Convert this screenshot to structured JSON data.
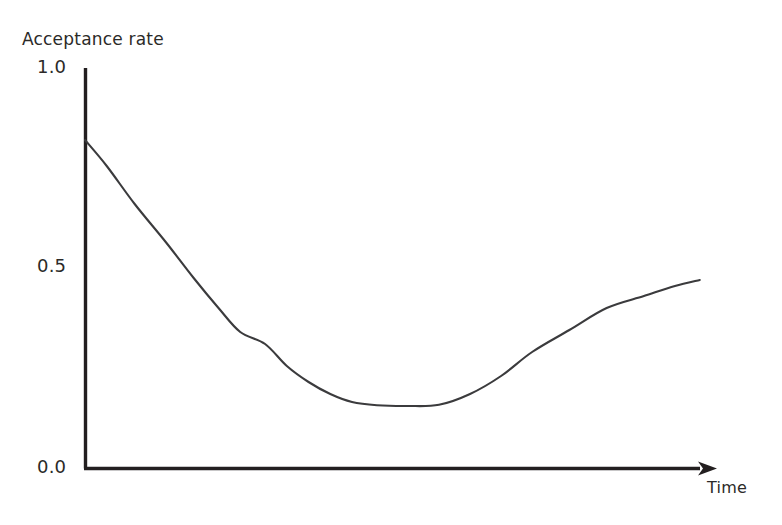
{
  "chart_data": {
    "type": "line",
    "title": "",
    "subtitle": "",
    "xlabel": "Time",
    "ylabel": "Acceptance rate",
    "ylim": [
      0.0,
      1.0
    ],
    "xlim": [
      0,
      1
    ],
    "grid": false,
    "legend": null,
    "legend_position": "none",
    "y_ticks": [
      "1.0",
      "0.5",
      "0.0"
    ],
    "y_tick_values": [
      1.0,
      0.5,
      0.0
    ],
    "x_ticks": [],
    "x_tick_values": [],
    "axis_style": "open-left-and-bottom-with-arrow",
    "series": [
      {
        "name": "Acceptance rate",
        "color": "#3b3b3d",
        "x": [
          0.0,
          0.035,
          0.08,
          0.13,
          0.175,
          0.215,
          0.25,
          0.29,
          0.325,
          0.36,
          0.395,
          0.43,
          0.47,
          0.52,
          0.57,
          0.62,
          0.67,
          0.72,
          0.78,
          0.84,
          0.9,
          0.95,
          0.99
        ],
        "y": [
          0.82,
          0.755,
          0.66,
          0.565,
          0.475,
          0.4,
          0.34,
          0.31,
          0.255,
          0.215,
          0.185,
          0.165,
          0.157,
          0.155,
          0.158,
          0.185,
          0.23,
          0.29,
          0.345,
          0.4,
          0.43,
          0.455,
          0.47
        ]
      }
    ],
    "annotations": [
      {
        "text": "Acceptance rate",
        "role": "y-axis-title"
      },
      {
        "text": "Time",
        "role": "x-axis-title"
      }
    ]
  },
  "axes": {
    "y_title": "Acceptance rate",
    "x_title": "Time",
    "tick_top": "1.0",
    "tick_mid": "0.5",
    "tick_bottom": "0.0"
  },
  "colors": {
    "background": "#ffffff",
    "axis": "#231f20",
    "curve": "#3b3b3d",
    "text": "#2b2a28"
  }
}
